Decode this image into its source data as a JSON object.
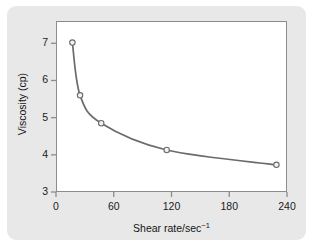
{
  "figure": {
    "panel_bg": "#e8e8e8",
    "plot_bg": "#ffffff",
    "frame_color": "#8c8c8c"
  },
  "chart_data": {
    "type": "line",
    "title": "",
    "xlabel": "Shear rate/sec",
    "xlabel_sup": "−1",
    "xlabel_full": "Shear rate/sec⁻¹",
    "ylabel": "Viscosity (cp)",
    "xlim": [
      0,
      240
    ],
    "ylim": [
      3,
      7.6
    ],
    "xticks": [
      0,
      60,
      120,
      180,
      240
    ],
    "xtick_labels": [
      "0",
      "60",
      "120",
      "180",
      "240"
    ],
    "yticks": [
      3,
      4,
      5,
      6,
      7
    ],
    "ytick_labels": [
      "3",
      "4",
      "5",
      "6",
      "7"
    ],
    "grid": false,
    "legend": null,
    "series": [
      {
        "name": "viscosity",
        "line_color": "#6b6b6b",
        "marker": "open-circle",
        "marker_face": "#f2f2f2",
        "marker_edge": "#6b6b6b",
        "x": [
          17,
          25,
          47,
          115,
          229
        ],
        "y": [
          7.02,
          5.6,
          4.85,
          4.13,
          3.73
        ],
        "points": [
          {
            "x": 17,
            "y": 7.02
          },
          {
            "x": 25,
            "y": 5.6
          },
          {
            "x": 47,
            "y": 4.85
          },
          {
            "x": 115,
            "y": 4.13
          },
          {
            "x": 229,
            "y": 3.73
          }
        ]
      }
    ]
  }
}
